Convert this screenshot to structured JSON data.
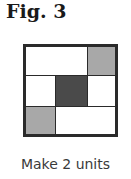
{
  "figure": {
    "title": "Fig. 3",
    "caption": "Make 2 units",
    "colors": {
      "border": "#2a2a2a",
      "white": "#ffffff",
      "light_gray": "#a8a8a8",
      "dark_gray": "#4a4a4a"
    },
    "grid": {
      "rows": 3,
      "cols": 3,
      "cells": [
        {
          "row": 0,
          "col": 0,
          "colspan": 2,
          "fill": "white"
        },
        {
          "row": 0,
          "col": 2,
          "colspan": 1,
          "fill": "light_gray"
        },
        {
          "row": 1,
          "col": 0,
          "colspan": 1,
          "fill": "white"
        },
        {
          "row": 1,
          "col": 1,
          "colspan": 1,
          "fill": "dark_gray"
        },
        {
          "row": 1,
          "col": 2,
          "colspan": 1,
          "fill": "white"
        },
        {
          "row": 2,
          "col": 0,
          "colspan": 1,
          "fill": "light_gray"
        },
        {
          "row": 2,
          "col": 1,
          "colspan": 2,
          "fill": "white"
        }
      ]
    }
  }
}
